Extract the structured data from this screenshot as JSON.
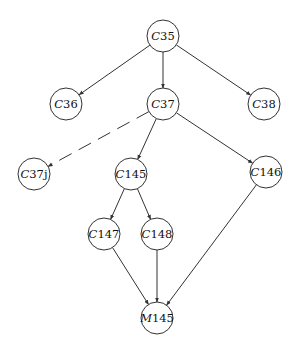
{
  "diagram": {
    "type": "tree-dag",
    "nodes": [
      {
        "id": "C35",
        "prefix": "C",
        "num": "35",
        "x": 163,
        "y": 36,
        "r": 16
      },
      {
        "id": "C36",
        "prefix": "C",
        "num": "36",
        "x": 66,
        "y": 104,
        "r": 16
      },
      {
        "id": "C37",
        "prefix": "C",
        "num": "37",
        "x": 163,
        "y": 104,
        "r": 16
      },
      {
        "id": "C38",
        "prefix": "C",
        "num": "38",
        "x": 264,
        "y": 104,
        "r": 16
      },
      {
        "id": "C37j",
        "prefix": "C",
        "num": "37j",
        "x": 34,
        "y": 174,
        "r": 16
      },
      {
        "id": "C145",
        "prefix": "C",
        "num": "145",
        "x": 131,
        "y": 174,
        "r": 16
      },
      {
        "id": "C146",
        "prefix": "C",
        "num": "146",
        "x": 266,
        "y": 172,
        "r": 16
      },
      {
        "id": "C147",
        "prefix": "C",
        "num": "147",
        "x": 104,
        "y": 234,
        "r": 16
      },
      {
        "id": "C148",
        "prefix": "C",
        "num": "148",
        "x": 157,
        "y": 234,
        "r": 16
      },
      {
        "id": "M145",
        "prefix": "M",
        "num": "145",
        "x": 157,
        "y": 318,
        "r": 16
      }
    ],
    "edges": [
      {
        "from": "C35",
        "to": "C36",
        "style": "solid"
      },
      {
        "from": "C35",
        "to": "C37",
        "style": "solid"
      },
      {
        "from": "C35",
        "to": "C38",
        "style": "solid"
      },
      {
        "from": "C37",
        "to": "C37j",
        "style": "dashed"
      },
      {
        "from": "C37",
        "to": "C145",
        "style": "solid"
      },
      {
        "from": "C37",
        "to": "C146",
        "style": "solid"
      },
      {
        "from": "C145",
        "to": "C147",
        "style": "solid"
      },
      {
        "from": "C145",
        "to": "C148",
        "style": "solid"
      },
      {
        "from": "C147",
        "to": "M145",
        "style": "solid"
      },
      {
        "from": "C148",
        "to": "M145",
        "style": "solid"
      },
      {
        "from": "C146",
        "to": "M145",
        "style": "solid"
      }
    ]
  }
}
